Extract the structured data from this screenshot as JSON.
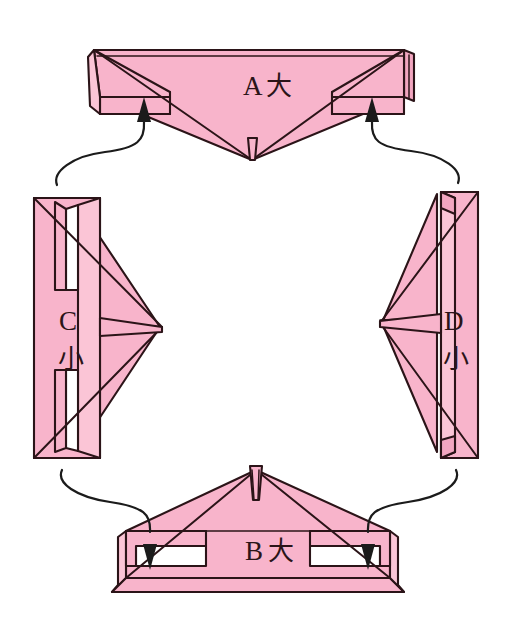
{
  "figure": {
    "kind": "origami-assembly-diagram",
    "background_color": "#ffffff",
    "paper_color": "#f8b4cb",
    "ink_color": "#2b1418",
    "piece_count": 4,
    "arrow_count": 4
  },
  "pieces": [
    {
      "id": "A",
      "name": "piece-a",
      "letter": "A",
      "size_char": "大",
      "size_meaning": "large",
      "position": "top",
      "orientation": "point-down"
    },
    {
      "id": "B",
      "name": "piece-b",
      "letter": "B",
      "size_char": "大",
      "size_meaning": "large",
      "position": "bottom",
      "orientation": "point-up"
    },
    {
      "id": "C",
      "name": "piece-c",
      "letter": "C",
      "size_char": "小",
      "size_meaning": "small",
      "position": "left",
      "orientation": "point-right"
    },
    {
      "id": "D",
      "name": "piece-d",
      "letter": "D",
      "size_char": "小",
      "size_meaning": "small",
      "position": "right",
      "orientation": "point-left"
    }
  ],
  "arrows": [
    {
      "id": "arrow-c-to-a",
      "from": "C",
      "to": "A",
      "direction": "up",
      "side": "left"
    },
    {
      "id": "arrow-d-to-a",
      "from": "D",
      "to": "A",
      "direction": "up",
      "side": "right"
    },
    {
      "id": "arrow-c-to-b",
      "from": "C",
      "to": "B",
      "direction": "down",
      "side": "left"
    },
    {
      "id": "arrow-d-to-b",
      "from": "D",
      "to": "B",
      "direction": "down",
      "side": "right"
    }
  ]
}
